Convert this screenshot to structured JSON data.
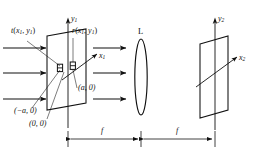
{
  "figure": {
    "kind": "optical-fourier-transform-setup",
    "stroke_color": "#111111",
    "background_color": "#ffffff"
  },
  "labels": {
    "transmittance": {
      "fn": "t",
      "args_open": "(",
      "x": "x",
      "xsub": "1",
      "comma": ", ",
      "y": "y",
      "ysub": "1",
      "args_close": ")"
    },
    "reference": {
      "fn": "r",
      "args_open": "(",
      "x": "x",
      "xsub": "1",
      "comma": ", ",
      "y": "y",
      "ysub": "1",
      "args_close": ")"
    },
    "axis_x1": {
      "name": "x",
      "sub": "1"
    },
    "axis_y1": {
      "name": "y",
      "sub": "1"
    },
    "axis_x2": {
      "name": "x",
      "sub": "2"
    },
    "axis_y2": {
      "name": "y",
      "sub": "2"
    },
    "lens": "L",
    "point_minus_a": "(−a, 0)",
    "point_origin": "(0, 0)",
    "point_plus_a": "(a, 0)",
    "focal_left": "f",
    "focal_right": "f"
  },
  "dimensions": {
    "left_span_label": "f",
    "right_span_label": "f"
  },
  "elements": {
    "input_plane_name": "input-transparency-plane",
    "lens_name": "converging-lens",
    "output_plane_name": "output-transform-plane",
    "aperture_left_name": "aperture-reference",
    "aperture_right_name": "aperture-object",
    "incoming_wave_name": "incident-plane-wave-arrows",
    "middle_wave_name": "propagating-wave-arrows"
  }
}
